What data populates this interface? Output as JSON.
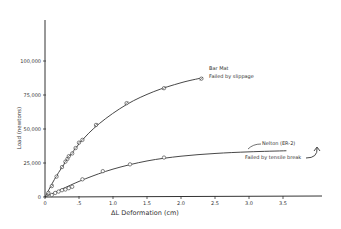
{
  "chart_data": {
    "type": "line",
    "title": "",
    "xlabel": "ΔL  Deformation (cm)",
    "ylabel": "Load (newtons)",
    "xlim": [
      0,
      4.0
    ],
    "ylim": [
      0,
      125000
    ],
    "x_ticks": [
      "0",
      ".5",
      "1.0",
      "1.5",
      "2.0",
      "2.5",
      "3.0",
      "3.5"
    ],
    "x_tick_values": [
      0,
      0.5,
      1.0,
      1.5,
      2.0,
      2.5,
      3.0,
      3.5
    ],
    "y_ticks": [
      "0",
      "25,000",
      "50,000",
      "75,000",
      "100,000"
    ],
    "y_tick_values": [
      0,
      25000,
      50000,
      75000,
      100000
    ],
    "grid": false,
    "series": [
      {
        "name": "Bar Mat",
        "annotation": "Failed by slippage",
        "marker": "open-circle-cross",
        "points": [
          [
            0.05,
            3000
          ],
          [
            0.1,
            8000
          ],
          [
            0.17,
            15000
          ],
          [
            0.25,
            22000
          ],
          [
            0.3,
            26000
          ],
          [
            0.33,
            28000
          ],
          [
            0.35,
            30000
          ],
          [
            0.4,
            32000
          ],
          [
            0.45,
            36000
          ],
          [
            0.5,
            40000
          ],
          [
            0.55,
            42000
          ],
          [
            0.75,
            53000
          ],
          [
            1.2,
            69000
          ],
          [
            1.75,
            80000
          ],
          [
            2.3,
            87000
          ]
        ],
        "curve": [
          [
            0,
            0
          ],
          [
            0.2,
            18000
          ],
          [
            0.5,
            39000
          ],
          [
            0.8,
            54000
          ],
          [
            1.2,
            68000
          ],
          [
            1.6,
            77500
          ],
          [
            2.0,
            84000
          ],
          [
            2.3,
            87500
          ]
        ]
      },
      {
        "name": "Nelton (ER-2)",
        "annotation": "Failed by tensile break",
        "marker": "open-circle",
        "points": [
          [
            0.1,
            1500
          ],
          [
            0.15,
            3000
          ],
          [
            0.2,
            4000
          ],
          [
            0.25,
            5000
          ],
          [
            0.3,
            5500
          ],
          [
            0.35,
            6500
          ],
          [
            0.4,
            7500
          ],
          [
            0.55,
            13000
          ],
          [
            0.85,
            19000
          ],
          [
            1.25,
            24000
          ],
          [
            1.75,
            29000
          ]
        ],
        "curve": [
          [
            0,
            0
          ],
          [
            0.3,
            7000
          ],
          [
            0.6,
            13500
          ],
          [
            1.0,
            20500
          ],
          [
            1.5,
            26500
          ],
          [
            2.0,
            30000
          ],
          [
            2.5,
            32000
          ],
          [
            3.0,
            33200
          ],
          [
            3.55,
            34000
          ]
        ]
      }
    ]
  }
}
